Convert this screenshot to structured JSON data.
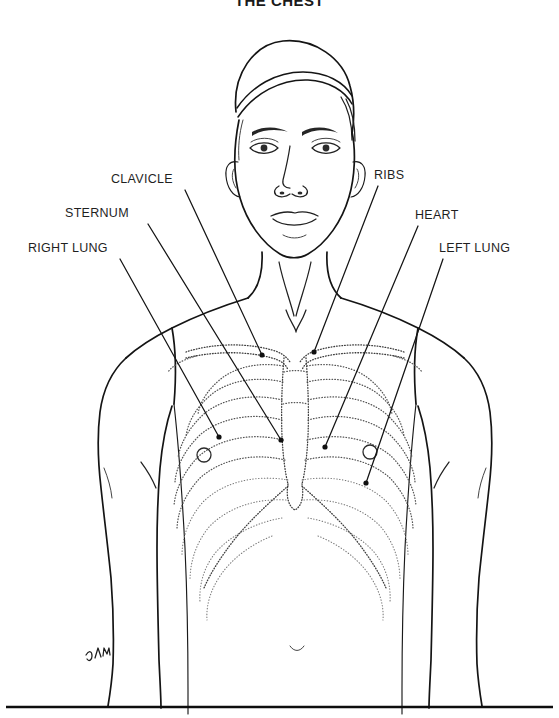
{
  "document": {
    "title": "THE CHEST",
    "subject": "human-chest-anatomy-line-drawing",
    "orientation": "anterior-view"
  },
  "labels": {
    "clavicle": "CLAVICLE",
    "sternum": "STERNUM",
    "right_lung": "RIGHT LUNG",
    "ribs": "RIBS",
    "heart": "HEART",
    "left_lung": "LEFT LUNG"
  },
  "annotations": [
    {
      "id": "clavicle",
      "label": "CLAVICLE",
      "side": "left",
      "label_position": {
        "x": 111,
        "y": 172
      },
      "leader_start": {
        "x": 185,
        "y": 190
      },
      "leader_end": {
        "x": 262,
        "y": 355
      },
      "endpoint_marker": "dot"
    },
    {
      "id": "sternum",
      "label": "STERNUM",
      "side": "left",
      "label_position": {
        "x": 65,
        "y": 206
      },
      "leader_start": {
        "x": 148,
        "y": 224
      },
      "leader_end": {
        "x": 281,
        "y": 440
      },
      "endpoint_marker": "dot"
    },
    {
      "id": "right_lung",
      "label": "RIGHT LUNG",
      "side": "left",
      "label_position": {
        "x": 28,
        "y": 241
      },
      "leader_start": {
        "x": 120,
        "y": 259
      },
      "leader_end": {
        "x": 219,
        "y": 437
      },
      "endpoint_marker": "dot"
    },
    {
      "id": "ribs",
      "label": "RIBS",
      "side": "right",
      "label_position": {
        "x": 374,
        "y": 168
      },
      "leader_start": {
        "x": 378,
        "y": 186
      },
      "leader_end": {
        "x": 314,
        "y": 352
      },
      "endpoint_marker": "dot"
    },
    {
      "id": "heart",
      "label": "HEART",
      "side": "right",
      "label_position": {
        "x": 415,
        "y": 208
      },
      "leader_start": {
        "x": 418,
        "y": 226
      },
      "leader_end": {
        "x": 325,
        "y": 447
      },
      "endpoint_marker": "dot"
    },
    {
      "id": "left_lung",
      "label": "LEFT LUNG",
      "side": "right",
      "label_position": {
        "x": 439,
        "y": 241
      },
      "leader_start": {
        "x": 443,
        "y": 259
      },
      "leader_end": {
        "x": 366,
        "y": 483
      },
      "endpoint_marker": "dot"
    }
  ],
  "anatomy_parts": [
    "head",
    "hair",
    "eyes",
    "eyebrows",
    "nose",
    "mouth",
    "ears",
    "neck",
    "shoulders",
    "arms",
    "clavicles",
    "sternum",
    "xiphoid-process",
    "rib-cage",
    "costal-margin",
    "nipples",
    "torso"
  ],
  "artist_signature": {
    "text": "DAHM",
    "position": {
      "x": 95,
      "y": 650
    }
  },
  "footer_rule": {
    "y": 707,
    "x_start": 6,
    "x_end": 553
  },
  "style": {
    "line_color": "#141414",
    "bone_stipple_color": "#555555",
    "background": "#ffffff",
    "label_color": "#1f1f1f",
    "title_color": "#1a1a1a"
  }
}
